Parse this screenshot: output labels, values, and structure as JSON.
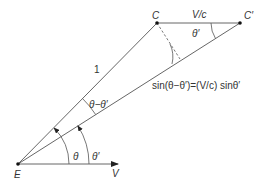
{
  "diagram": {
    "points": {
      "E": {
        "label": "E",
        "x": 18,
        "y": 164
      },
      "C": {
        "label": "C",
        "x": 157,
        "y": 23
      },
      "C_prime": {
        "label": "C′",
        "x": 240,
        "y": 23
      },
      "V_tip": {
        "x": 118,
        "y": 164
      }
    },
    "labels": {
      "E": "E",
      "C": "C",
      "C_prime": "C′",
      "V": "V",
      "V_over_c": "V/c",
      "one": "1",
      "theta": "θ",
      "theta_prime_bottom": "θ′",
      "theta_prime_top": "θ′",
      "theta_minus_theta_prime": "θ−θ′",
      "equation": "sin(θ−θ′)=(V/c) sinθ′"
    },
    "colors": {
      "line": "#555555",
      "text": "#333333",
      "background": "#ffffff"
    }
  }
}
